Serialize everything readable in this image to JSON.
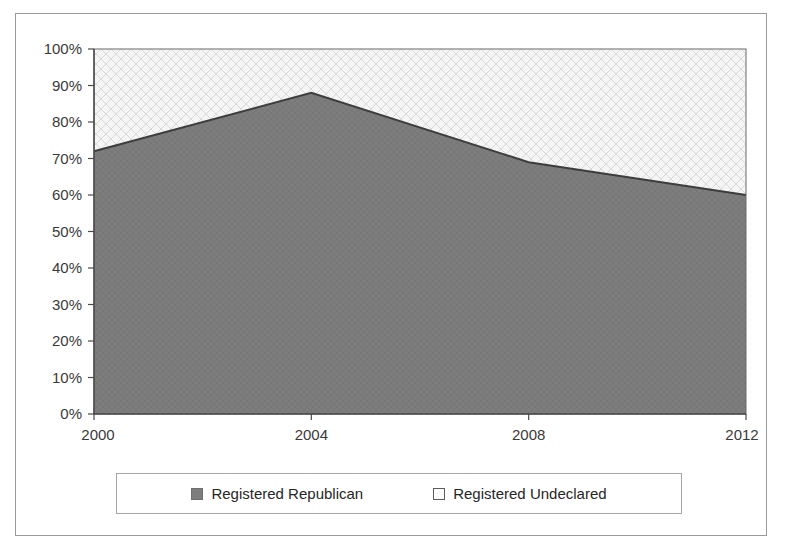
{
  "chart_data": {
    "type": "area",
    "stacked": true,
    "title": "",
    "subtitle": "",
    "xlabel": "",
    "ylabel": "",
    "x": [
      2000,
      2004,
      2008,
      2012
    ],
    "categories": [
      "2000",
      "2004",
      "2008",
      "2012"
    ],
    "series": [
      {
        "name": "Registered Republican",
        "values": [
          72,
          88,
          69,
          60
        ],
        "color": "#7d7d7d",
        "fill_style": "solid-gray-texture"
      },
      {
        "name": "Registered Undeclared",
        "values": [
          28,
          12,
          31,
          40
        ],
        "color": "#f4f4f4",
        "fill_style": "light-crosshatch"
      }
    ],
    "ylim": [
      0,
      100
    ],
    "xlim": [
      2000,
      2012
    ],
    "y_tick_labels": [
      "0%",
      "10%",
      "20%",
      "30%",
      "40%",
      "50%",
      "60%",
      "70%",
      "80%",
      "90%",
      "100%"
    ],
    "y_tick_values": [
      0,
      10,
      20,
      30,
      40,
      50,
      60,
      70,
      80,
      90,
      100
    ],
    "x_tick_labels": [
      "2000",
      "2004",
      "2008",
      "2012"
    ],
    "x_tick_values": [
      2000,
      2004,
      2008,
      2012
    ],
    "grid": false,
    "legend_position": "bottom"
  },
  "legend": {
    "entries": [
      {
        "label": "Registered Republican",
        "marker": "filled-square-icon"
      },
      {
        "label": "Registered Undeclared",
        "marker": "hollow-square-icon"
      }
    ]
  },
  "colors": {
    "republican_fill": "#7d7d7d",
    "undeclared_fill": "#f4f4f4",
    "boundary_line": "#3d3d3d",
    "axis": "#4a4a4a",
    "frame_border": "#9a9a9a"
  }
}
